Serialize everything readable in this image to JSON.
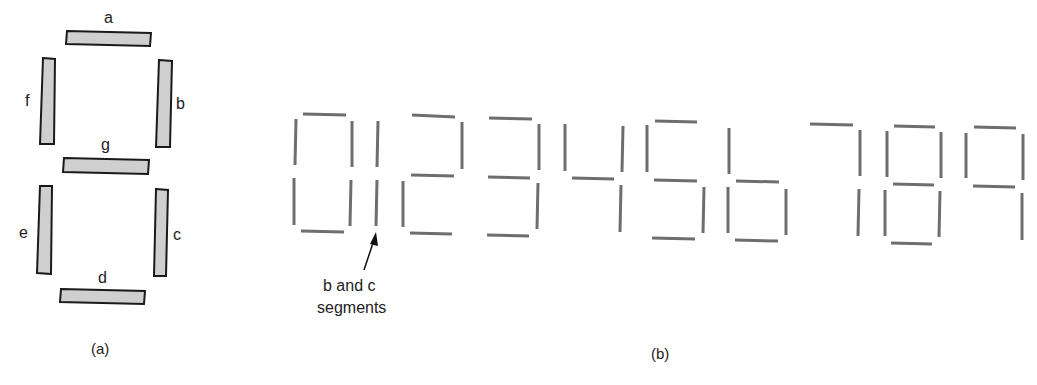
{
  "figure_a": {
    "caption": "(a)",
    "segments": [
      {
        "id": "a",
        "label": "a"
      },
      {
        "id": "b",
        "label": "b"
      },
      {
        "id": "c",
        "label": "c"
      },
      {
        "id": "d",
        "label": "d"
      },
      {
        "id": "e",
        "label": "e"
      },
      {
        "id": "f",
        "label": "f"
      },
      {
        "id": "g",
        "label": "g"
      }
    ]
  },
  "figure_b": {
    "caption": "(b)",
    "digits": [
      "0",
      "1",
      "2",
      "3",
      "4",
      "5",
      "6",
      "7",
      "8",
      "9"
    ],
    "annotation": {
      "line1": "b and c",
      "line2": "segments"
    }
  },
  "colors": {
    "segment_fill": "#cfcfcf",
    "segment_outline": "#1a1a1a",
    "digit_stroke": "#6e6e6e"
  }
}
